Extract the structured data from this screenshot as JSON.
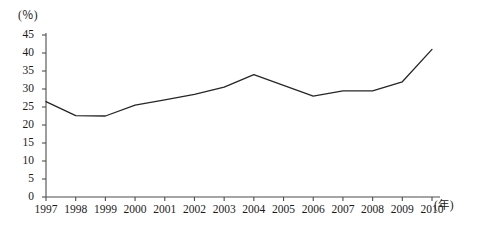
{
  "chart_data": {
    "type": "line",
    "title": "",
    "xlabel": "(年)",
    "ylabel": "(％)",
    "categories": [
      "1997",
      "1998",
      "1999",
      "2000",
      "2001",
      "2002",
      "2003",
      "2004",
      "2005",
      "2006",
      "2007",
      "2008",
      "2009",
      "2010"
    ],
    "values": [
      26.5,
      22.6,
      22.5,
      25.5,
      27,
      28.5,
      30.5,
      34,
      31,
      28,
      29.5,
      29.5,
      32,
      41
    ],
    "series": [
      {
        "name": "",
        "values": [
          26.5,
          22.6,
          22.5,
          25.5,
          27,
          28.5,
          30.5,
          34,
          31,
          28,
          29.5,
          29.5,
          32,
          41
        ]
      }
    ],
    "ylim": [
      0,
      45
    ],
    "yticks": [
      0,
      5,
      10,
      15,
      20,
      25,
      30,
      35,
      40,
      45
    ],
    "ytick_labels": [
      "0",
      "5",
      "10",
      "15",
      "20",
      "25",
      "30",
      "35",
      "40",
      "45"
    ],
    "grid": false,
    "legend": "none",
    "line_color": "#262626",
    "axis_color": "#4d4d4d"
  },
  "axes": {
    "y_unit_label": "(％)",
    "x_unit_label": "(年)"
  }
}
